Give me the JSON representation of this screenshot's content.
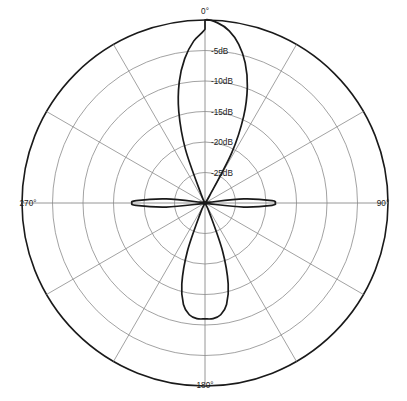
{
  "chart_data": {
    "type": "line",
    "subtype": "polar-radiation-pattern",
    "title": "",
    "xlabel": "",
    "ylabel": "",
    "grid": true,
    "legend": null,
    "angle_unit": "degrees",
    "angle_direction": "clockwise",
    "angle_zero_at": "top",
    "radial_unit": "dB",
    "radial_axis": {
      "outer_value_db": 0,
      "center_value_db": -30,
      "tick_step_db": 5,
      "tick_labels": [
        "-5dB",
        "-10dB",
        "-15dB",
        "-20dB",
        "-25dB"
      ],
      "tick_values_db": [
        -5,
        -10,
        -15,
        -20,
        -25
      ],
      "ring_count": 6
    },
    "angular_axis": {
      "tick_labels": [
        "0°",
        "90°",
        "180°",
        "270°"
      ],
      "tick_values": [
        0,
        90,
        180,
        270
      ],
      "spoke_step_deg": 30
    },
    "lobes": [
      {
        "name": "main-lobe",
        "center_deg": 0,
        "peak_db": 0,
        "half_width_deg": 18
      },
      {
        "name": "back-lobe",
        "center_deg": 180,
        "peak_db": -11,
        "half_width_deg": 14
      },
      {
        "name": "side-lobe-right",
        "center_deg": 90,
        "peak_db": -18.5,
        "half_width_deg": 12
      },
      {
        "name": "side-lobe-left",
        "center_deg": 270,
        "peak_db": -18,
        "half_width_deg": 12
      }
    ],
    "series": [
      {
        "name": "radiation-pattern",
        "color": "#1a1a1a",
        "theta_deg": [
          0,
          4,
          8,
          12,
          16,
          20,
          24,
          28,
          32,
          36,
          40,
          44,
          48,
          52,
          56,
          60,
          64,
          68,
          72,
          76,
          80,
          84,
          88,
          90,
          92,
          96,
          100,
          104,
          108,
          112,
          116,
          120,
          124,
          128,
          132,
          136,
          140,
          144,
          148,
          152,
          156,
          160,
          164,
          168,
          172,
          176,
          180,
          184,
          188,
          192,
          196,
          200,
          204,
          208,
          212,
          216,
          220,
          224,
          228,
          232,
          236,
          240,
          244,
          248,
          252,
          256,
          260,
          264,
          268,
          270,
          272,
          276,
          280,
          284,
          288,
          292,
          296,
          300,
          304,
          308,
          312,
          316,
          320,
          324,
          328,
          332,
          336,
          340,
          344,
          348,
          352,
          356,
          360
        ],
        "values_db": [
          0,
          -0.4,
          -1.5,
          -3.4,
          -6.1,
          -9.7,
          -14.4,
          -20.6,
          -28.5,
          -30,
          -30,
          -30,
          -30,
          -30,
          -30,
          -30,
          -30,
          -30,
          -30,
          -30,
          -29.2,
          -23.6,
          -19.0,
          -18.5,
          -19.0,
          -23.6,
          -29.2,
          -30,
          -30,
          -30,
          -30,
          -30,
          -30,
          -30,
          -30,
          -30,
          -30,
          -30,
          -30,
          -30,
          -28.0,
          -21.5,
          -16.2,
          -13.0,
          -11.5,
          -11.0,
          -11.0,
          -11.0,
          -11.5,
          -13.0,
          -16.2,
          -21.5,
          -28.0,
          -30,
          -30,
          -30,
          -30,
          -30,
          -30,
          -30,
          -30,
          -30,
          -30,
          -30,
          -30,
          -30,
          -29.2,
          -23.6,
          -18.7,
          -18.0,
          -18.7,
          -23.6,
          -29.2,
          -30,
          -30,
          -30,
          -30,
          -30,
          -30,
          -30,
          -30,
          -30,
          -30,
          -30,
          -30,
          -30,
          -28.5,
          -20.6,
          -14.4,
          -9.7,
          -6.1,
          -3.4,
          -1.5,
          -0.4,
          0
        ]
      }
    ]
  },
  "labels": {
    "angle_0": "0°",
    "angle_90": "90°",
    "angle_180": "180°",
    "angle_270": "270°",
    "r_5": "-5dB",
    "r_10": "-10dB",
    "r_15": "-15dB",
    "r_20": "-20dB",
    "r_25": "-25dB"
  },
  "colors": {
    "background": "#ffffff",
    "grid": "#8a8a8a",
    "outer_ring": "#1a1a1a",
    "curve": "#1a1a1a",
    "text": "#1a1a1a"
  }
}
